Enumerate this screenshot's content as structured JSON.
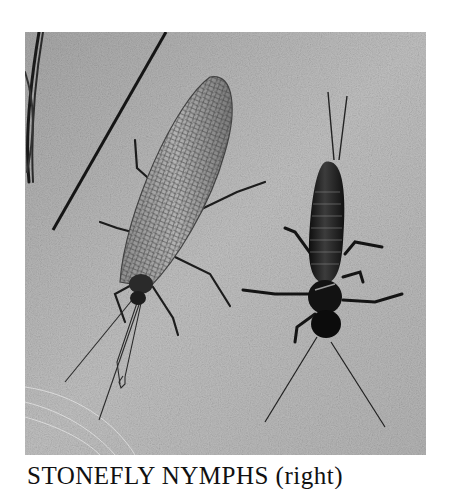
{
  "figure": {
    "subjects": [
      {
        "label": "adult stonefly",
        "position": "left",
        "icon": "winged-insect-icon"
      },
      {
        "label": "stonefly nymph",
        "position": "right",
        "icon": "nymph-insect-icon"
      }
    ],
    "background": "sandstone-texture",
    "tone": "grayscale"
  },
  "caption": {
    "text": "STONEFLY NYMPHS (right)"
  },
  "colors": {
    "paper": "#ffffff",
    "stone": "#b9b9b9",
    "ink": "#111111"
  }
}
